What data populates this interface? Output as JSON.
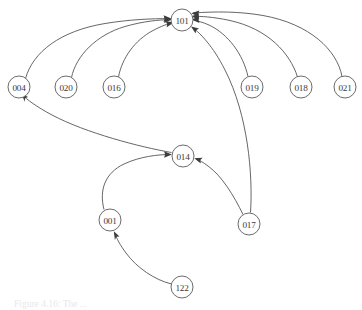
{
  "figure": {
    "caption": "Figure 4.16: The ...",
    "background_color": "#ffffff",
    "node_stroke_color": "#5a5a5a",
    "edge_stroke_color": "#4a4a4a",
    "label_color": "#3a3a3a"
  },
  "graph": {
    "type": "directed-graph",
    "node_radius": 11,
    "nodes": [
      {
        "id": "101",
        "label": "101",
        "x": 182,
        "y": 20
      },
      {
        "id": "004",
        "label": "004",
        "x": 19,
        "y": 87
      },
      {
        "id": "020",
        "label": "020",
        "x": 66,
        "y": 87
      },
      {
        "id": "016",
        "label": "016",
        "x": 114,
        "y": 87
      },
      {
        "id": "019",
        "label": "019",
        "x": 252,
        "y": 87
      },
      {
        "id": "018",
        "label": "018",
        "x": 301,
        "y": 87
      },
      {
        "id": "021",
        "label": "021",
        "x": 345,
        "y": 87
      },
      {
        "id": "014",
        "label": "014",
        "x": 183,
        "y": 156
      },
      {
        "id": "017",
        "label": "017",
        "x": 249,
        "y": 224
      },
      {
        "id": "001",
        "label": "001",
        "x": 110,
        "y": 220
      },
      {
        "id": "122",
        "label": "122",
        "x": 182,
        "y": 287
      }
    ],
    "edges": [
      {
        "from": "004",
        "to": "101",
        "directed": true
      },
      {
        "from": "020",
        "to": "101",
        "directed": true
      },
      {
        "from": "016",
        "to": "101",
        "directed": true
      },
      {
        "from": "019",
        "to": "101",
        "directed": true
      },
      {
        "from": "018",
        "to": "101",
        "directed": true
      },
      {
        "from": "021",
        "to": "101",
        "directed": true
      },
      {
        "from": "017",
        "to": "101",
        "directed": true
      },
      {
        "from": "014",
        "to": "004",
        "directed": true
      },
      {
        "from": "001",
        "to": "014",
        "directed": true
      },
      {
        "from": "017",
        "to": "014",
        "directed": true
      },
      {
        "from": "122",
        "to": "001",
        "directed": true
      }
    ]
  }
}
